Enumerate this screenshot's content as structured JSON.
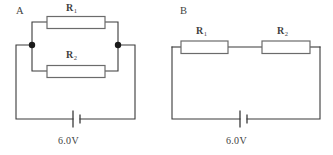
{
  "figure": {
    "background_color": "#ffffff",
    "wire_color": "#3a3a3a",
    "resistor_border_color": "#6b6b6b",
    "node_color": "#1a1a1a"
  },
  "circuits": [
    {
      "letter": "A",
      "arrangement": "parallel",
      "resistors": [
        {
          "label": "R",
          "subscript": "1",
          "position": "top-branch"
        },
        {
          "label": "R",
          "subscript": "2",
          "position": "bottom-branch"
        }
      ],
      "source": {
        "type": "battery",
        "voltage": "6.0V"
      },
      "junction_dots": 2
    },
    {
      "letter": "B",
      "arrangement": "series",
      "resistors": [
        {
          "label": "R",
          "subscript": "1",
          "position": "left"
        },
        {
          "label": "R",
          "subscript": "2",
          "position": "right"
        }
      ],
      "source": {
        "type": "battery",
        "voltage": "6.0V"
      },
      "junction_dots": 0
    }
  ]
}
